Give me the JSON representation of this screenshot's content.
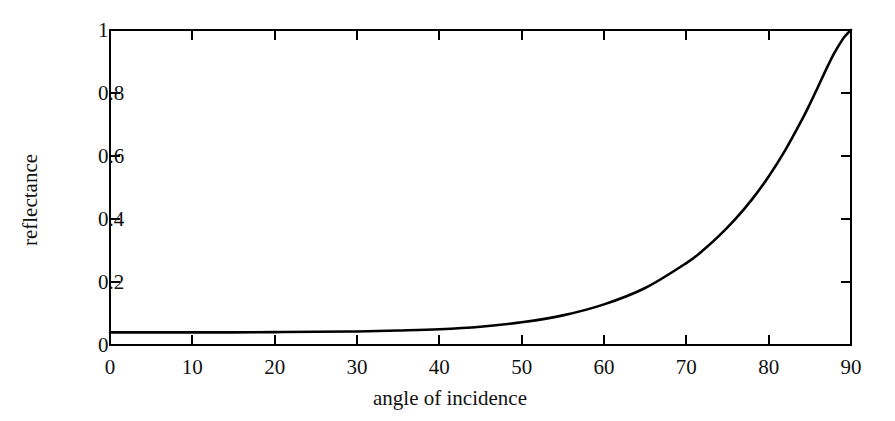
{
  "chart_data": {
    "type": "line",
    "title": "",
    "subtitle": "",
    "xlabel": "angle of incidence",
    "ylabel": "reflectance",
    "xlim": [
      0,
      90
    ],
    "ylim": [
      0,
      1
    ],
    "xticks": [
      0,
      10,
      20,
      30,
      40,
      50,
      60,
      70,
      80,
      90
    ],
    "xtick_labels": [
      "0",
      "10",
      "20",
      "30",
      "40",
      "50",
      "60",
      "70",
      "80",
      "90"
    ],
    "yticks": [
      0,
      0.2,
      0.4,
      0.6,
      0.8,
      1
    ],
    "ytick_labels": [
      "0",
      "0.2",
      "0.4",
      "0.6",
      "0.8",
      "1"
    ],
    "grid": false,
    "legend": false,
    "legend_position": "none",
    "frame": "box",
    "tick_direction": "in",
    "line_color": "#000000",
    "axis_color": "#000000",
    "background_color": "#ffffff",
    "line_width": 2.6,
    "series": [
      {
        "name": "reflectance",
        "x": [
          0,
          5,
          10,
          15,
          20,
          25,
          30,
          35,
          40,
          45,
          50,
          55,
          60,
          65,
          70,
          72,
          74,
          76,
          78,
          80,
          82,
          84,
          85,
          86,
          87,
          88,
          89,
          89.5,
          90
        ],
        "values": [
          0.04,
          0.04,
          0.04,
          0.04,
          0.041,
          0.042,
          0.043,
          0.046,
          0.05,
          0.058,
          0.072,
          0.094,
          0.129,
          0.181,
          0.26,
          0.3,
          0.347,
          0.401,
          0.463,
          0.535,
          0.618,
          0.713,
          0.765,
          0.82,
          0.876,
          0.928,
          0.971,
          0.987,
          1.0
        ]
      }
    ],
    "annotations": []
  },
  "axes": {
    "x_title": "angle of incidence",
    "y_title": "reflectance",
    "x_tick_labels": [
      "0",
      "10",
      "20",
      "30",
      "40",
      "50",
      "60",
      "70",
      "80",
      "90"
    ],
    "y_tick_labels": [
      "0",
      "0.2",
      "0.4",
      "0.6",
      "0.8",
      "1"
    ]
  }
}
